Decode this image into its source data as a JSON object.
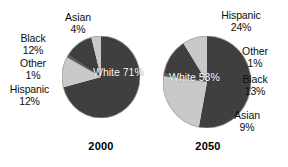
{
  "figure": {
    "background": "#ffffff",
    "colors": {
      "dark_slice": "#3f3f3f",
      "light_slice": "#c9c9c9",
      "outline": "#8a8a8a",
      "inner_text": "#ffffff",
      "label_text": "#0d0d0d"
    }
  },
  "chart_data": [
    {
      "type": "pie",
      "title": "2000",
      "categories": [
        "White",
        "Hispanic",
        "Other",
        "Black",
        "Asian"
      ],
      "values": [
        71,
        12,
        1,
        12,
        4
      ],
      "labels": [
        "White 71%",
        "Hispanic 12%",
        "Other 1%",
        "Black 12%",
        "Asian 4%"
      ],
      "start_angle_deg": 0,
      "direction": "clockwise",
      "slice_colors": [
        "#3f3f3f",
        "#c9c9c9",
        "#3f3f3f",
        "#3f3f3f",
        "#c9c9c9"
      ],
      "legend": "none",
      "grid": false,
      "xlabel": "",
      "ylabel": ""
    },
    {
      "type": "pie",
      "title": "2050",
      "categories": [
        "White",
        "Hispanic",
        "Other",
        "Black",
        "Asian"
      ],
      "values": [
        53,
        24,
        1,
        13,
        9
      ],
      "labels": [
        "White 53%",
        "Hispanic 24%",
        "Other 1%",
        "Black 13%",
        "Asian 9%"
      ],
      "start_angle_deg": 0,
      "direction": "clockwise",
      "slice_colors": [
        "#3f3f3f",
        "#c9c9c9",
        "#3f3f3f",
        "#3f3f3f",
        "#c9c9c9"
      ],
      "legend": "none",
      "grid": false,
      "xlabel": "",
      "ylabel": ""
    }
  ],
  "chart2000": {
    "year": "2000",
    "inner": {
      "name": "White",
      "pct": "71%"
    },
    "outer": [
      {
        "name": "Asian",
        "pct": "4%"
      },
      {
        "name": "Black",
        "pct": "12%"
      },
      {
        "name": "Other",
        "pct": "1%"
      },
      {
        "name": "Hispanic",
        "pct": "12%"
      }
    ]
  },
  "chart2050": {
    "year": "2050",
    "inner": {
      "name": "White",
      "pct": "53%"
    },
    "outer": [
      {
        "name": "Hispanic",
        "pct": "24%"
      },
      {
        "name": "Other",
        "pct": "1%"
      },
      {
        "name": "Black",
        "pct": "13%"
      },
      {
        "name": "Asian",
        "pct": "9%"
      }
    ]
  }
}
